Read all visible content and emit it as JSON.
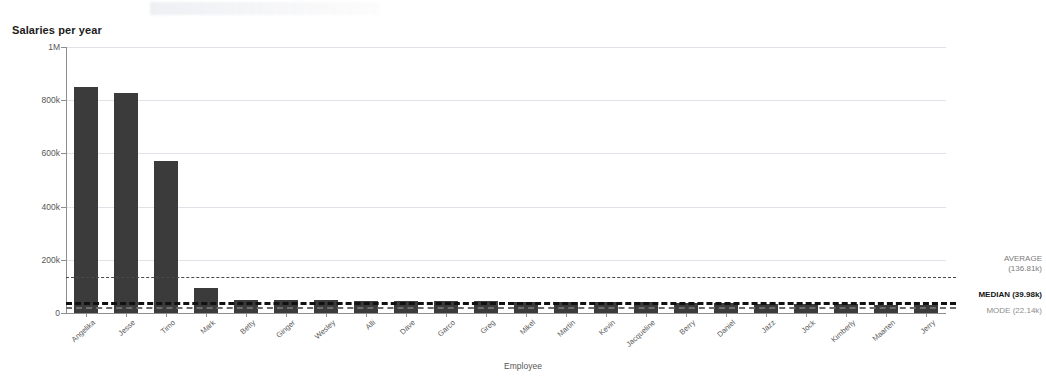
{
  "chart_data": {
    "type": "bar",
    "title": "Salaries per year",
    "xlabel": "Employee",
    "ylabel": "Sum(Salary)",
    "ylim": [
      0,
      1000000
    ],
    "grid": true,
    "legend_position": "right-inline",
    "y_ticks": [
      {
        "value": 1000000,
        "label": "1M"
      },
      {
        "value": 800000,
        "label": "800k"
      },
      {
        "value": 600000,
        "label": "600k"
      },
      {
        "value": 400000,
        "label": "400k"
      },
      {
        "value": 200000,
        "label": "200k"
      },
      {
        "value": 0,
        "label": "0"
      }
    ],
    "categories": [
      "Angelika",
      "Jesse",
      "Timo",
      "Mark",
      "Betty",
      "Ginger",
      "Wesley",
      "Alli",
      "Dave",
      "Garco",
      "Greg",
      "Mikel",
      "Martin",
      "Kevin",
      "Jacqueline",
      "Berry",
      "Daniel",
      "Jazz",
      "Jock",
      "Kimberly",
      "Maarten",
      "Jerry"
    ],
    "values": [
      851000,
      828000,
      571000,
      95000,
      50000,
      50000,
      48000,
      47000,
      46000,
      45000,
      44000,
      43000,
      42000,
      41000,
      40000,
      38000,
      36000,
      35000,
      34000,
      33000,
      32000,
      31000
    ],
    "series": [
      {
        "name": "Sum(Salary)",
        "color": "#3b3b3b",
        "values": [
          851000,
          828000,
          571000,
          95000,
          50000,
          50000,
          48000,
          47000,
          46000,
          45000,
          44000,
          43000,
          42000,
          41000,
          40000,
          38000,
          36000,
          35000,
          34000,
          33000,
          32000,
          31000
        ]
      }
    ],
    "reference_lines": [
      {
        "key": "average",
        "name": "AVERAGE",
        "value": 136810,
        "value_label": "(136.81k)",
        "label_line1": "AVERAGE",
        "label_line2": "(136.81k)",
        "color": "#4a4a4a",
        "style": "dashed"
      },
      {
        "key": "median",
        "name": "MEDIAN",
        "value": 39980,
        "value_label": "(39.98k)",
        "label_line1": "MEDIAN (39.98k)",
        "label_line2": "",
        "color": "#111111",
        "style": "dashed-bold"
      },
      {
        "key": "mode",
        "name": "MODE",
        "value": 22140,
        "value_label": "(22.14k)",
        "label_line1": "MODE (22.14k)",
        "label_line2": "",
        "color": "#8d8d8d",
        "style": "dashed"
      }
    ]
  }
}
